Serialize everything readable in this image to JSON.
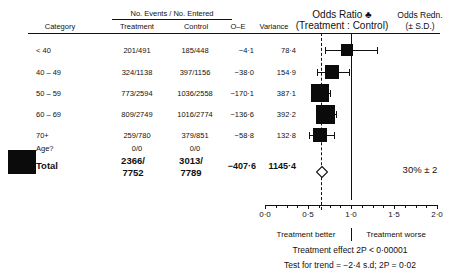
{
  "header": {
    "category": "Category",
    "events_entered": "No. Events / No. Entered",
    "treatment": "Treatment",
    "control": "Control",
    "o_e": "O–E",
    "variance": "Variance",
    "odds_ratio_line1": "Odds Ratio ♣",
    "odds_ratio_line2": "(Treatment : Control)",
    "odds_redn_line1": "Odds Redn.",
    "odds_redn_line2": "(± S.D.)"
  },
  "rows": [
    {
      "category": "< 40",
      "treatment": "201/491",
      "control": "185/448",
      "o_e": "−4·1",
      "variance": "78·4"
    },
    {
      "category": "40 – 49",
      "treatment": "324/1138",
      "control": "397/1156",
      "o_e": "−38·0",
      "variance": "154·9"
    },
    {
      "category": "50 – 59",
      "treatment": "773/2594",
      "control": "1036/2558",
      "o_e": "−170·1",
      "variance": "387·1"
    },
    {
      "category": "60 – 69",
      "treatment": "809/2749",
      "control": "1016/2774",
      "o_e": "−136·6",
      "variance": "392·2"
    },
    {
      "category": "70+",
      "treatment": "259/780",
      "control": "379/851",
      "o_e": "−58·8",
      "variance": "132·8"
    },
    {
      "category": "Age?",
      "treatment": "0/0",
      "control": "0/0",
      "o_e": "",
      "variance": ""
    }
  ],
  "total": {
    "label": "Total",
    "treatment_line1": "2366/",
    "treatment_line2": "7752",
    "control_line1": "3013/",
    "control_line2": "7789",
    "o_e": "−407·6",
    "variance": "1145·4",
    "odds_redn": "30% ± 2"
  },
  "axis": {
    "ticks": [
      "0·0",
      "0·5",
      "1·0",
      "1·5",
      "2·0"
    ],
    "min": 0.0,
    "max": 2.0,
    "null_value": 1.0,
    "summary_value": 0.66
  },
  "footer": {
    "treatment_better": "Treatment better",
    "treatment_worse": "Treatment worse",
    "effect": "Treatment effect 2P < 0·00001",
    "trend": "Test for trend = −2·4 s.d; 2P = 0·02"
  },
  "colors": {
    "ink": "#111111",
    "marker": "#0b0b0b",
    "background": "#ffffff"
  },
  "chart_data": {
    "type": "forest",
    "xlabel": "Odds Ratio",
    "ylabel": "Category",
    "xlim": [
      0.0,
      2.0
    ],
    "xticks": [
      0.0,
      0.5,
      1.0,
      1.5,
      2.0
    ],
    "grid": false,
    "reference_line": 1.0,
    "summary_line": 0.66,
    "categories": [
      "< 40",
      "40 – 49",
      "50 – 59",
      "60 – 69",
      "70+",
      "Age?",
      "Total"
    ],
    "points": [
      {
        "category": "< 40",
        "odds_ratio": 0.95,
        "ci_low": 0.7,
        "ci_high": 1.3,
        "o_e": -4.1,
        "variance": 78.4,
        "box_weight": 78.4,
        "marker": "filled-square"
      },
      {
        "category": "40 – 49",
        "odds_ratio": 0.78,
        "ci_low": 0.6,
        "ci_high": 0.98,
        "o_e": -38.0,
        "variance": 154.9,
        "box_weight": 154.9,
        "marker": "filled-square"
      },
      {
        "category": "50 – 59",
        "odds_ratio": 0.64,
        "ci_low": 0.53,
        "ci_high": 0.76,
        "o_e": -170.1,
        "variance": 387.1,
        "box_weight": 387.1,
        "marker": "filled-square"
      },
      {
        "category": "60 – 69",
        "odds_ratio": 0.7,
        "ci_low": 0.59,
        "ci_high": 0.83,
        "o_e": -136.6,
        "variance": 392.2,
        "box_weight": 392.2,
        "marker": "filled-square"
      },
      {
        "category": "70+",
        "odds_ratio": 0.64,
        "ci_low": 0.51,
        "ci_high": 0.8,
        "o_e": -58.8,
        "variance": 132.8,
        "box_weight": 132.8,
        "marker": "filled-square"
      },
      {
        "category": "Total",
        "odds_ratio": 0.66,
        "ci_low": 0.62,
        "ci_high": 0.7,
        "o_e": -407.6,
        "variance": 1145.4,
        "box_weight": 1145.4,
        "marker": "open-diamond"
      }
    ],
    "annotations": [
      "Treatment better",
      "Treatment worse",
      "Treatment effect 2P < 0·00001",
      "Test for trend = −2·4 s.d; 2P = 0·02",
      "30% ± 2"
    ]
  }
}
